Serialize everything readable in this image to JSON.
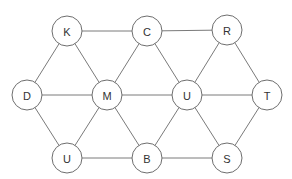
{
  "diagram": {
    "type": "graph",
    "node_radius": 15,
    "nodes": [
      {
        "id": "K",
        "label": "K",
        "x": 67,
        "y": 31
      },
      {
        "id": "C",
        "label": "C",
        "x": 147,
        "y": 31
      },
      {
        "id": "R",
        "label": "R",
        "x": 227,
        "y": 30
      },
      {
        "id": "D",
        "label": "D",
        "x": 27,
        "y": 95
      },
      {
        "id": "M",
        "label": "M",
        "x": 107,
        "y": 95
      },
      {
        "id": "U1",
        "label": "U",
        "x": 187,
        "y": 95
      },
      {
        "id": "T",
        "label": "T",
        "x": 267,
        "y": 95
      },
      {
        "id": "U2",
        "label": "U",
        "x": 67,
        "y": 158
      },
      {
        "id": "B",
        "label": "B",
        "x": 147,
        "y": 158
      },
      {
        "id": "S",
        "label": "S",
        "x": 227,
        "y": 158
      }
    ],
    "edges": [
      [
        "K",
        "C"
      ],
      [
        "C",
        "R"
      ],
      [
        "K",
        "D"
      ],
      [
        "K",
        "M"
      ],
      [
        "C",
        "M"
      ],
      [
        "C",
        "U1"
      ],
      [
        "R",
        "U1"
      ],
      [
        "R",
        "T"
      ],
      [
        "D",
        "M"
      ],
      [
        "M",
        "U1"
      ],
      [
        "U1",
        "T"
      ],
      [
        "D",
        "U2"
      ],
      [
        "M",
        "U2"
      ],
      [
        "M",
        "B"
      ],
      [
        "U1",
        "B"
      ],
      [
        "U1",
        "S"
      ],
      [
        "T",
        "S"
      ],
      [
        "U2",
        "B"
      ],
      [
        "B",
        "S"
      ]
    ]
  }
}
